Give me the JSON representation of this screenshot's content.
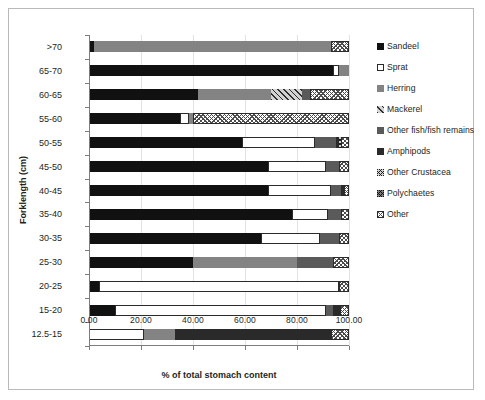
{
  "chart_data": {
    "type": "bar",
    "orientation": "horizontal",
    "stacked": true,
    "title": "",
    "xlabel": "% of total stomach content",
    "ylabel": "Forklength (cm)",
    "xlim": [
      0,
      100
    ],
    "xticks": [
      "0.00",
      "20.00",
      "40.00",
      "60.00",
      "80.00",
      "100.00"
    ],
    "xtick_values": [
      0,
      20,
      40,
      60,
      80,
      100
    ],
    "grid": true,
    "legend_position": "right",
    "categories": [
      ">70",
      "65-70",
      "60-65",
      "55-60",
      "50-55",
      "45-50",
      "40-45",
      "35-40",
      "30-35",
      "25-30",
      "20-25",
      "15-20",
      "12.5-15"
    ],
    "series": [
      {
        "name": "Sandeel",
        "key": "sandeel",
        "fill": "f-sandeel",
        "values": [
          2.0,
          94.0,
          42.0,
          35.0,
          59.0,
          69.0,
          69.0,
          78.0,
          66.0,
          40.0,
          4.0,
          10.0,
          0.0
        ]
      },
      {
        "name": "Sprat",
        "key": "sprat",
        "fill": "f-sprat",
        "values": [
          0.0,
          2.0,
          0.0,
          3.5,
          28.0,
          22.0,
          24.0,
          14.0,
          23.0,
          0.0,
          92.0,
          81.0,
          21.0
        ]
      },
      {
        "name": "Herring",
        "key": "herring",
        "fill": "f-herring",
        "values": [
          91.0,
          4.0,
          28.0,
          1.5,
          0.0,
          0.0,
          0.0,
          0.0,
          0.0,
          40.0,
          0.0,
          0.0,
          12.0
        ]
      },
      {
        "name": "Mackerel",
        "key": "mackerel",
        "fill": "f-mackerel",
        "values": [
          0.0,
          0.0,
          12.0,
          0.0,
          0.0,
          0.0,
          0.0,
          0.0,
          0.0,
          0.0,
          0.0,
          0.0,
          0.0
        ]
      },
      {
        "name": "Other fish/fish remains",
        "key": "otherfish",
        "fill": "f-otherfish",
        "values": [
          0.0,
          0.0,
          3.0,
          0.0,
          8.0,
          5.0,
          4.0,
          5.0,
          7.0,
          14.0,
          0.0,
          3.0,
          0.0
        ]
      },
      {
        "name": "Amphipods",
        "key": "amphipods",
        "fill": "f-amphipods",
        "values": [
          0.0,
          0.0,
          0.0,
          0.0,
          1.0,
          0.0,
          1.0,
          0.0,
          0.0,
          0.0,
          0.0,
          2.5,
          60.0
        ]
      },
      {
        "name": "Other Crustacea",
        "key": "crustacea",
        "fill": "f-crustacea",
        "values": [
          0.0,
          0.0,
          0.0,
          0.0,
          1.0,
          0.0,
          0.0,
          0.0,
          0.0,
          0.0,
          0.0,
          0.0,
          0.0
        ]
      },
      {
        "name": "Polychaetes",
        "key": "polychaetes",
        "fill": "f-polychaetes",
        "values": [
          0.0,
          0.0,
          0.0,
          0.0,
          0.0,
          0.0,
          0.0,
          0.0,
          0.0,
          0.0,
          0.0,
          0.0,
          0.0
        ]
      },
      {
        "name": "Other",
        "key": "other",
        "fill": "f-other",
        "values": [
          7.0,
          0.0,
          15.0,
          60.0,
          3.0,
          4.0,
          2.0,
          3.0,
          4.0,
          6.0,
          4.0,
          3.5,
          7.0
        ]
      }
    ]
  },
  "legend": {
    "items": [
      {
        "label": "Sandeel",
        "fill": "f-sandeel"
      },
      {
        "label": "Sprat",
        "fill": "f-sprat"
      },
      {
        "label": "Herring",
        "fill": "f-herring"
      },
      {
        "label": "Mackerel",
        "fill": "f-mackerel"
      },
      {
        "label": "Other fish/fish remains",
        "fill": "f-otherfish"
      },
      {
        "label": "Amphipods",
        "fill": "f-amphipods"
      },
      {
        "label": "Other Crustacea",
        "fill": "f-crustacea"
      },
      {
        "label": "Polychaetes",
        "fill": "f-polychaetes"
      },
      {
        "label": "Other",
        "fill": "f-other"
      }
    ]
  }
}
